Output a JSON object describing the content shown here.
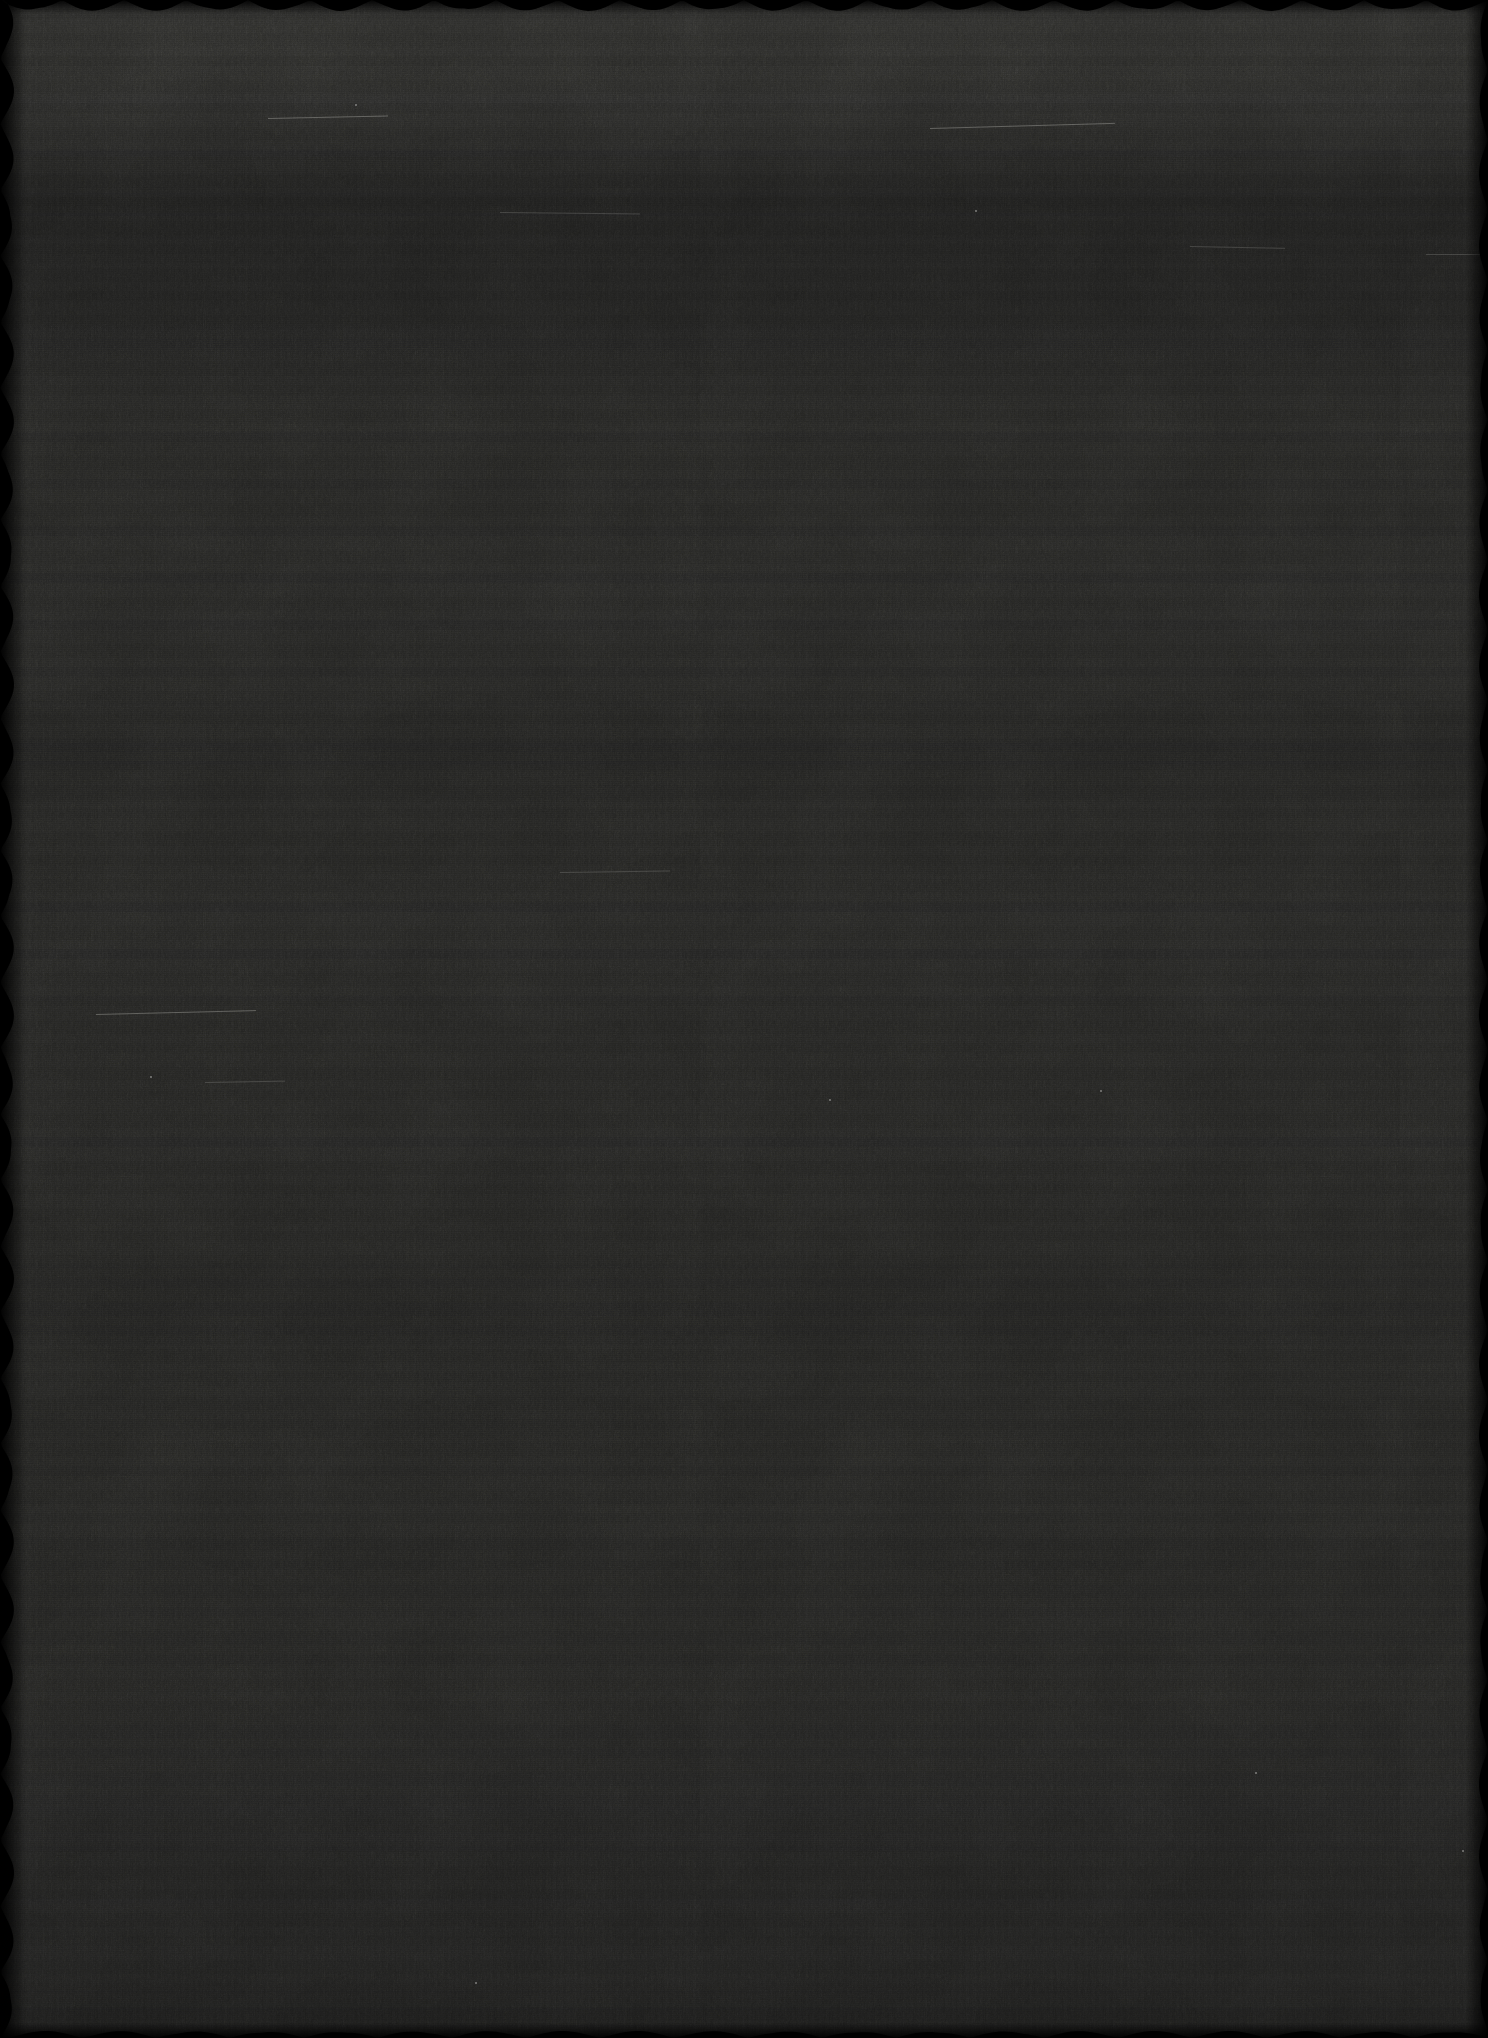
{
  "image": {
    "kind": "photographic-scan",
    "subject": "blank-underexposed-frame",
    "width_px": 1488,
    "height_px": 2038,
    "orientation": "portrait",
    "visible_text": "",
    "description": "A near-uniformly black scanned photographic frame. No legible subject, text, UI, or graphic content is present. Visible characteristics are film grain, fine horizontal scanner banding, broad lighter/darker horizontal zones, a few faint light hairline scratches and dust specks, and a dark scalloped deckle edge around the perimeter."
  },
  "palette": {
    "background": "#000000",
    "base_tone": "#121211",
    "band_light": "#1c1c1b",
    "band_dark": "#0a0a0a",
    "mid_tone": "#161615",
    "edge_black": "#000000",
    "scratch_highlight": "#e1e1dc",
    "speck_highlight": "#ebebe6"
  },
  "tone_profile": {
    "type": "vertical_luminance_bands",
    "note": "Approximate 8-bit grey level sampled down the frame centre.",
    "y_positions": [
      0,
      95,
      200,
      300,
      430,
      620,
      900,
      1150,
      1400,
      1650,
      1880,
      2038
    ],
    "grey_levels": [
      28,
      24,
      13,
      11,
      22,
      26,
      24,
      27,
      23,
      20,
      16,
      10
    ]
  },
  "texture": {
    "grain": "film-grain, fine isotropic with horizontally stretched weave",
    "banding": "horizontal scan lines, ~1-2px fine period plus ~19-47px broad period",
    "mottle": "low-frequency blotching"
  },
  "edges": {
    "style": "deckle / scalloped",
    "top": {
      "present": true,
      "period_px": 62,
      "depth_px": 11
    },
    "bottom": {
      "present": true,
      "period_px": 74,
      "depth_px": 7
    },
    "left": {
      "present": true,
      "period_px": 66,
      "depth_px": 14
    },
    "right": {
      "present": true,
      "period_px": 70,
      "depth_px": 9
    }
  },
  "artifacts": {
    "scratches": [
      {
        "x": 268,
        "y": 118,
        "length": 120,
        "angle_deg": -1.2,
        "intensity": "faint"
      },
      {
        "x": 930,
        "y": 128,
        "length": 185,
        "angle_deg": -1.6,
        "intensity": "faint"
      },
      {
        "x": 500,
        "y": 212,
        "length": 140,
        "angle_deg": 0.6,
        "intensity": "very-faint"
      },
      {
        "x": 96,
        "y": 1014,
        "length": 160,
        "angle_deg": -1.4,
        "intensity": "faint"
      },
      {
        "x": 1190,
        "y": 246,
        "length": 95,
        "angle_deg": 1.1,
        "intensity": "very-faint"
      },
      {
        "x": 560,
        "y": 872,
        "length": 110,
        "angle_deg": -0.8,
        "intensity": "very-faint"
      },
      {
        "x": 1426,
        "y": 254,
        "length": 60,
        "angle_deg": 0.0,
        "intensity": "very-faint"
      },
      {
        "x": 205,
        "y": 1082,
        "length": 80,
        "angle_deg": -1.0,
        "intensity": "very-faint"
      }
    ],
    "specks": [
      {
        "x": 355,
        "y": 104
      },
      {
        "x": 829,
        "y": 1099
      },
      {
        "x": 1255,
        "y": 1772
      },
      {
        "x": 1100,
        "y": 1090
      },
      {
        "x": 475,
        "y": 1982
      },
      {
        "x": 150,
        "y": 1076
      },
      {
        "x": 1462,
        "y": 1850
      },
      {
        "x": 975,
        "y": 210
      }
    ]
  }
}
